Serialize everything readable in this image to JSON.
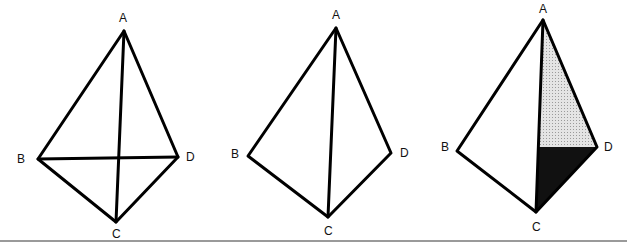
{
  "figures": [
    {
      "id": "fig1",
      "description": "Tetrahedron ABCD with edges including diagonal BD and AC crossing",
      "labels": {
        "A": "A",
        "B": "B",
        "C": "C",
        "D": "D"
      },
      "vertices": {
        "A": [
          124,
          31
        ],
        "B": [
          38,
          159
        ],
        "C": [
          116,
          222
        ],
        "D": [
          178,
          157
        ]
      },
      "edges": [
        [
          "A",
          "B"
        ],
        [
          "A",
          "D"
        ],
        [
          "A",
          "C"
        ],
        [
          "B",
          "C"
        ],
        [
          "C",
          "D"
        ],
        [
          "B",
          "D"
        ]
      ]
    },
    {
      "id": "fig2",
      "description": "Quadrilateral ABCD with diagonal AC (BD removed)",
      "labels": {
        "A": "A",
        "B": "B",
        "C": "C",
        "D": "D"
      },
      "vertices": {
        "A": [
          336,
          28
        ],
        "B": [
          248,
          156
        ],
        "C": [
          328,
          217
        ],
        "D": [
          391,
          153
        ]
      },
      "edges": [
        [
          "A",
          "B"
        ],
        [
          "A",
          "D"
        ],
        [
          "A",
          "C"
        ],
        [
          "B",
          "C"
        ],
        [
          "C",
          "D"
        ]
      ]
    },
    {
      "id": "fig3",
      "description": "Quadrilateral ABCD with diagonal AC; triangle ACD shaded light gray on top and black below horizontal from D",
      "labels": {
        "A": "A",
        "B": "B",
        "C": "C",
        "D": "D"
      },
      "vertices": {
        "A": [
          543,
          20
        ],
        "B": [
          457,
          151
        ],
        "C": [
          536,
          212
        ],
        "D": [
          597,
          147
        ]
      },
      "edges": [
        [
          "A",
          "B"
        ],
        [
          "A",
          "D"
        ],
        [
          "A",
          "C"
        ],
        [
          "B",
          "C"
        ],
        [
          "C",
          "D"
        ]
      ],
      "shading": {
        "light": "#d9d9d9",
        "dark": "#111111",
        "split_point": [
          539,
          147
        ]
      }
    }
  ],
  "colors": {
    "stroke": "#000000",
    "background": "#ffffff",
    "rule": "#888888"
  }
}
